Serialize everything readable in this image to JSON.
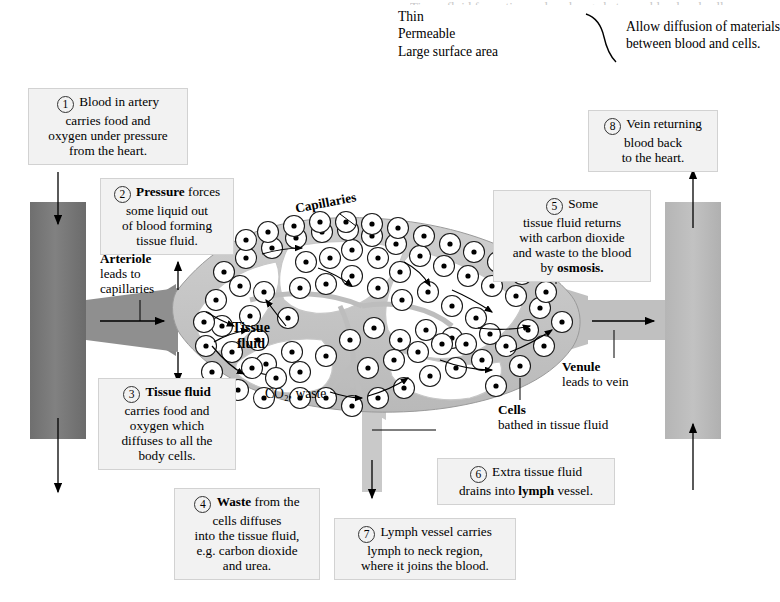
{
  "title": "Tissue fluid formation and exchange between blood and cells",
  "header": {
    "properties": [
      "Thin",
      "Permeable",
      "Large surface area"
    ],
    "bracket_icon": "curly-brace-right",
    "result_line1": "Allow diffusion of materials",
    "result_line2": "between blood and cells."
  },
  "callouts": [
    {
      "number": "1",
      "lines": [
        [
          {
            "t": "Blood in artery",
            "b": false
          }
        ],
        [
          {
            "t": "carries food and",
            "b": false
          }
        ],
        [
          {
            "t": "oxygen under pressure",
            "b": false
          }
        ],
        [
          {
            "t": "from the heart.",
            "b": false
          }
        ]
      ]
    },
    {
      "number": "2",
      "lines": [
        [
          {
            "t": "Pressure ",
            "b": true
          },
          {
            "t": "forces",
            "b": false
          }
        ],
        [
          {
            "t": "some liquid out",
            "b": false
          }
        ],
        [
          {
            "t": "of blood forming",
            "b": false
          }
        ],
        [
          {
            "t": "tissue fluid.",
            "b": false
          }
        ]
      ]
    },
    {
      "number": "3",
      "lines": [
        [
          {
            "t": "Tissue fluid",
            "b": true
          }
        ],
        [
          {
            "t": "carries food and",
            "b": false
          }
        ],
        [
          {
            "t": "oxygen which",
            "b": false
          }
        ],
        [
          {
            "t": "diffuses to all the",
            "b": false
          }
        ],
        [
          {
            "t": "body cells.",
            "b": false
          }
        ]
      ]
    },
    {
      "number": "4",
      "lines": [
        [
          {
            "t": "Waste ",
            "b": true
          },
          {
            "t": "from the",
            "b": false
          }
        ],
        [
          {
            "t": "cells diffuses",
            "b": false
          }
        ],
        [
          {
            "t": "into the tissue fluid,",
            "b": false
          }
        ],
        [
          {
            "t": "e.g. carbon dioxide",
            "b": false
          }
        ],
        [
          {
            "t": "and urea.",
            "b": false
          }
        ]
      ]
    },
    {
      "number": "5",
      "lines": [
        [
          {
            "t": "Some",
            "b": false
          }
        ],
        [
          {
            "t": "tissue fluid returns",
            "b": false
          }
        ],
        [
          {
            "t": "with carbon dioxide",
            "b": false
          }
        ],
        [
          {
            "t": "and waste to the blood",
            "b": false
          }
        ],
        [
          {
            "t": "by ",
            "b": false
          },
          {
            "t": "osmosis.",
            "b": true
          }
        ]
      ]
    },
    {
      "number": "6",
      "lines": [
        [
          {
            "t": "Extra tissue fluid",
            "b": false
          }
        ],
        [
          {
            "t": "drains into ",
            "b": false
          },
          {
            "t": "lymph",
            "b": true
          },
          {
            "t": " vessel.",
            "b": false
          }
        ]
      ]
    },
    {
      "number": "7",
      "lines": [
        [
          {
            "t": "Lymph vessel carries",
            "b": false
          }
        ],
        [
          {
            "t": "lymph to neck region,",
            "b": false
          }
        ],
        [
          {
            "t": "where it joins the blood.",
            "b": false
          }
        ]
      ]
    },
    {
      "number": "8",
      "lines": [
        [
          {
            "t": "Vein returning",
            "b": false
          }
        ],
        [
          {
            "t": "blood back",
            "b": false
          }
        ],
        [
          {
            "t": "to the heart.",
            "b": false
          }
        ]
      ]
    }
  ],
  "labels": {
    "arteriole": {
      "head": "Arteriole",
      "line2": "leads to",
      "line3": "capillaries"
    },
    "venule": {
      "head": "Venule",
      "line2": "leads to vein"
    },
    "capillaries": "Capillaries",
    "tissue_fluid": {
      "line1": "Tissue",
      "line2": "fluid"
    },
    "co2_waste": "CO₂, waste",
    "cells": {
      "head": "Cells",
      "line2": "bathed in tissue fluid"
    }
  },
  "colors": {
    "artery": "#767676",
    "vein": "#b8b8b8",
    "capillary_fill": "#ffffff",
    "capillary_wall": "#bdbdbd",
    "lymph": "#c9c9c9",
    "callout_bg": "#f2f2f2",
    "callout_border": "#d2d2d2",
    "page_bg": "#ffffff",
    "ink": "#000000"
  },
  "cell_glyph": "cell-circle-with-nucleus"
}
